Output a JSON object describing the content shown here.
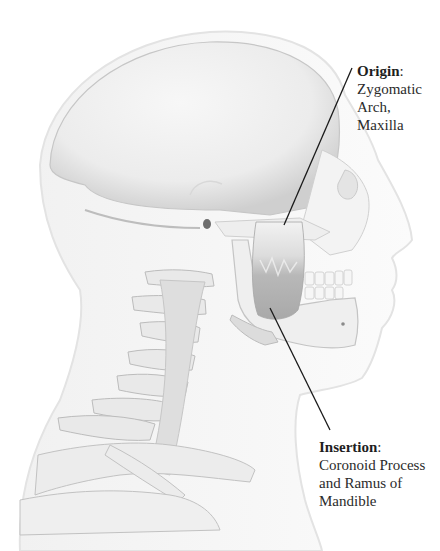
{
  "diagram": {
    "colors": {
      "background": "#ffffff",
      "skin_outline": "#e2e2e2",
      "bone": "#efefef",
      "bone_shadow": "#c9c9c9",
      "muscle": "#b9b9b9",
      "leader_line": "#1a1a1a",
      "text": "#2b2b2b"
    },
    "labels": {
      "origin": {
        "title": "Origin",
        "separator": ":",
        "lines": [
          "Zygomatic",
          "Arch, Maxilla"
        ]
      },
      "insertion": {
        "title": "Insertion",
        "separator": ":",
        "lines": [
          "Coronoid Process",
          "and Ramus of",
          "Mandible"
        ]
      }
    },
    "leader_lines": {
      "origin": {
        "x1": 352,
        "y1": 68,
        "x2": 284,
        "y2": 225
      },
      "insertion": {
        "x1": 270,
        "y1": 308,
        "x2": 330,
        "y2": 430
      }
    }
  }
}
